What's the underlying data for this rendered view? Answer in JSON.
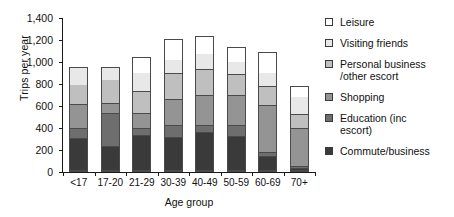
{
  "chart_data": {
    "type": "bar",
    "subtype": "stacked-vertical",
    "title": "",
    "xlabel": "Age group",
    "ylabel": "Trips per year",
    "ylim": [
      0,
      1400
    ],
    "ytick_step": 200,
    "ytick_labels": [
      "0",
      "200",
      "400",
      "600",
      "800",
      "1,000",
      "1,200",
      "1,400"
    ],
    "ytick_values": [
      0,
      200,
      400,
      600,
      800,
      1000,
      1200,
      1400
    ],
    "grid": false,
    "legend_position": "right",
    "categories": [
      "<17",
      "17-20",
      "21-29",
      "30-39",
      "40-49",
      "50-59",
      "60-69",
      "70+"
    ],
    "series": [
      {
        "name": "Commute/business",
        "color": "#3a3a3a",
        "values": [
          290,
          220,
          315,
          300,
          350,
          310,
          130,
          15
        ]
      },
      {
        "name": "Education (inc escort)",
        "color": "#6e6e6e",
        "values": [
          90,
          300,
          70,
          110,
          60,
          95,
          30,
          25
        ]
      },
      {
        "name": "Shopping",
        "color": "#949494",
        "values": [
          220,
          90,
          135,
          235,
          275,
          280,
          430,
          340
        ]
      },
      {
        "name": "Personal business /other escort",
        "color": "#bfbfbf",
        "values": [
          180,
          220,
          195,
          240,
          235,
          185,
          175,
          130
        ]
      },
      {
        "name": "Visiting friends",
        "color": "#e8e8e8",
        "values": [
          160,
          110,
          175,
          120,
          140,
          120,
          125,
          160
        ]
      },
      {
        "name": "Leisure",
        "color": "#ffffff",
        "values": [
          0,
          0,
          0,
          0,
          0,
          0,
          0,
          0
        ]
      }
    ],
    "totals": [
      940,
      940,
      1030,
      1190,
      1215,
      1120,
      1070,
      760
    ],
    "note_stack_order_bottom_to_top": [
      "Commute/business",
      "Education (inc escort)",
      "Shopping",
      "Personal business /other escort",
      "Visiting friends",
      "Leisure"
    ]
  },
  "legend": {
    "items": [
      {
        "label": "Leisure",
        "color": "#ffffff"
      },
      {
        "label": "Visiting friends",
        "color": "#e8e8e8"
      },
      {
        "label": "Personal business\n/other escort",
        "color": "#bfbfbf"
      },
      {
        "label": "Shopping",
        "color": "#949494"
      },
      {
        "label": "Education (inc\nescort)",
        "color": "#6e6e6e"
      },
      {
        "label": "Commute/business",
        "color": "#3a3a3a"
      }
    ]
  }
}
